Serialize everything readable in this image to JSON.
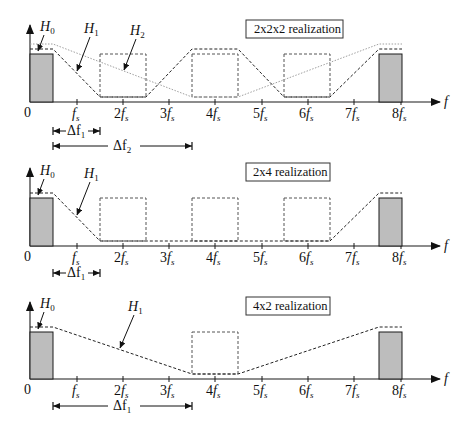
{
  "figure": {
    "axis_label_f": "f",
    "origin_label": "0",
    "tick_labels": [
      {
        "num": "",
        "sub": "s"
      },
      {
        "num": "2",
        "sub": "s"
      },
      {
        "num": "3",
        "sub": "s"
      },
      {
        "num": "4",
        "sub": "s"
      },
      {
        "num": "5",
        "sub": "s"
      },
      {
        "num": "6",
        "sub": "s"
      },
      {
        "num": "7",
        "sub": "s"
      },
      {
        "num": "8",
        "sub": "s"
      }
    ],
    "panels": [
      {
        "title": "2x2x2  realization",
        "curves": [
          "H0",
          "H1",
          "H2"
        ],
        "H0_label": {
          "main": "H",
          "sub": "0"
        },
        "H1_label": {
          "main": "H",
          "sub": "1"
        },
        "H2_label": {
          "main": "H",
          "sub": "2"
        },
        "dimensions": [
          {
            "label_main": "Δf",
            "label_sub": "1",
            "from": "0.5 fs",
            "to": "1.5 fs"
          },
          {
            "label_main": "Δf",
            "label_sub": "2",
            "from": "0.5 fs",
            "to": "3.5 fs"
          }
        ]
      },
      {
        "title": "2x4  realization",
        "curves": [
          "H0",
          "H1"
        ],
        "H0_label": {
          "main": "H",
          "sub": "0"
        },
        "H1_label": {
          "main": "H",
          "sub": "1"
        },
        "dimensions": [
          {
            "label_main": "Δf",
            "label_sub": "1",
            "from": "0.5 fs",
            "to": "1.5 fs"
          }
        ]
      },
      {
        "title": "4x2  realization",
        "curves": [
          "H0",
          "H1"
        ],
        "H0_label": {
          "main": "H",
          "sub": "0"
        },
        "H1_label": {
          "main": "H",
          "sub": "1"
        },
        "dimensions": [
          {
            "label_main": "Δf",
            "label_sub": "1",
            "from": "0.5 fs",
            "to": "3.5 fs"
          }
        ]
      }
    ],
    "colors": {
      "block_fill": "#bdbdbd",
      "h1_dashed": "#222222",
      "h2_dotted": "#a0a0a0",
      "dashed_box": "#555555"
    }
  }
}
